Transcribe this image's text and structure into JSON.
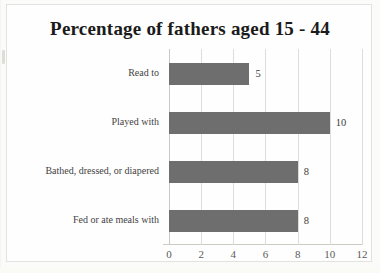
{
  "document": {
    "background_color": "#fbfbf9",
    "page_color": "#fefefe",
    "border_color": "#e2e2de"
  },
  "chart_data": {
    "type": "bar",
    "orientation": "horizontal",
    "title": "Percentage of fathers aged 15 - 44",
    "xlabel": "",
    "ylabel": "",
    "categories": [
      "Read to",
      "Played with",
      "Bathed, dressed, or diapered",
      "Fed or ate meals with"
    ],
    "values": [
      5,
      10,
      8,
      8
    ],
    "data_labels": [
      "5",
      "10",
      "8",
      "8"
    ],
    "xlim": [
      0,
      12
    ],
    "xticks": [
      0,
      2,
      4,
      6,
      8,
      10,
      12
    ],
    "xtick_labels": [
      "0",
      "2",
      "4",
      "6",
      "8",
      "10",
      "12"
    ],
    "grid": true,
    "grid_orientation": "vertical",
    "legend": false,
    "bar_color": "#6e6e6e",
    "grid_color": "#dcdcd8",
    "axis_color": "#c9c9c4",
    "title_color": "#1b1b1b",
    "label_color": "#434343",
    "tick_color": "#5a5a5a"
  }
}
